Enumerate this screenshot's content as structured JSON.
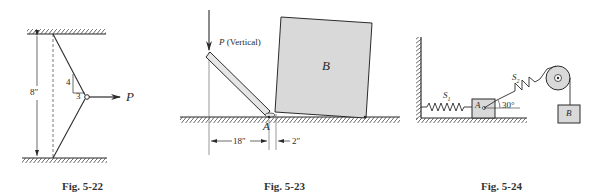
{
  "figures": [
    {
      "id": "fig-5-22",
      "caption": "Fig. 5-22",
      "labels": {
        "dimension": "8″",
        "slope_rise": "4",
        "slope_run": "3",
        "force": "P"
      }
    },
    {
      "id": "fig-5-23",
      "caption": "Fig. 5-23",
      "labels": {
        "force": "P",
        "force_note": "(Vertical)",
        "block": "B",
        "point": "A",
        "dim_left": "18″",
        "dim_right": "2″"
      }
    },
    {
      "id": "fig-5-24",
      "caption": "Fig. 5-24",
      "labels": {
        "spring1": "S",
        "spring1_sub": "1",
        "spring2": "S",
        "spring2_sub": "2",
        "block_a": "A",
        "angle": "30°",
        "block_b": "B"
      }
    }
  ],
  "colors": {
    "line": "#2b2b2b",
    "block_fill": "#d9d9d9",
    "bar_fill": "#e6e6e6",
    "background": "#ffffff"
  }
}
